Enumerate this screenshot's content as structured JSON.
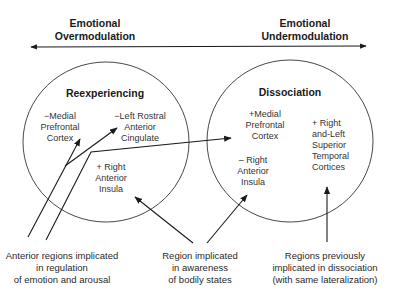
{
  "axis": {
    "left_label": [
      "Emotional",
      "Overmodulation"
    ],
    "right_label": [
      "Emotional",
      "Undermodulation"
    ]
  },
  "circles": {
    "reexperiencing": {
      "title": "Reexperiencing",
      "regions": {
        "medial_pfc": [
          "−Medial",
          "Prefrontal",
          "Cortex"
        ],
        "left_rostral_acc": [
          "−Left Rostral",
          "Anterior",
          "Cingulate"
        ],
        "right_insula": [
          "+ Right",
          "Anterior",
          "Insula"
        ]
      }
    },
    "dissociation": {
      "title": "Dissociation",
      "regions": {
        "medial_pfc": [
          "+Medial",
          "Prefrontal",
          "Cortex"
        ],
        "right_insula": [
          "– Right",
          "Anterior",
          "Insula"
        ],
        "superior_temporal": [
          "+ Right",
          "and-Left",
          "Superior",
          "Temporal",
          "Cortices"
        ]
      }
    }
  },
  "captions": {
    "anterior": [
      "Anterior regions implicated",
      "in regulation",
      "of emotion and arousal"
    ],
    "bodily": [
      "Region implicated",
      "in awareness",
      "of bodily states"
    ],
    "dissociation": [
      "Regions previously",
      "implicated in dissociation",
      "(with same lateralization)"
    ]
  },
  "colors": {
    "line": "#1a1a1a",
    "text": "#2a2a2a",
    "background": "#ffffff"
  }
}
